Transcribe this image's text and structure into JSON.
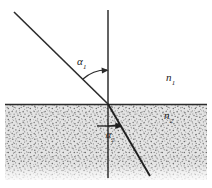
{
  "figure": {
    "background_color": "#ffffff",
    "ink_color": "#1a1a1a",
    "medium_fill_color": "#c9c9c9",
    "width": 212,
    "height": 188
  },
  "labels": {
    "incidence_angle": {
      "symbol": "α",
      "subscript": "1"
    },
    "refraction_angle": {
      "symbol": "α",
      "subscript": "2"
    },
    "index_upper": {
      "symbol": "n",
      "subscript": "1"
    },
    "index_lower": {
      "symbol": "n",
      "subscript": "2"
    }
  },
  "geometry": {
    "interface_y": 104,
    "interface_x_start": 5,
    "interface_x_end": 207,
    "incidence_point": {
      "x": 108,
      "y": 104
    },
    "normal_line": {
      "x": 108,
      "y_top": 10,
      "y_bottom": 178
    },
    "incident_ray": {
      "x1": 14,
      "y1": 12,
      "x2": 108,
      "y2": 104
    },
    "refracted_ray": {
      "x1": 108,
      "y1": 104,
      "x2": 150,
      "y2": 176
    },
    "lower_medium_bottom_y": 180
  },
  "icons": {
    "incidence_arc": "angle-arc-icon",
    "refraction_arc": "angle-arc-icon",
    "arrowhead": "arrowhead-icon"
  }
}
